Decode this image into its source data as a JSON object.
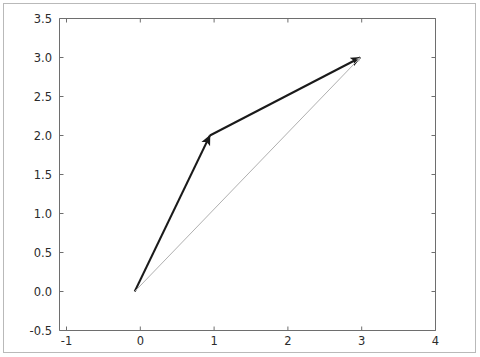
{
  "chart_data": {
    "type": "line",
    "title": "",
    "xlabel": "",
    "ylabel": "",
    "xlim": [
      -1,
      4
    ],
    "ylim": [
      -0.5,
      3.5
    ],
    "grid": false,
    "legend": null,
    "xticks": [
      "-1",
      "0",
      "1",
      "2",
      "3",
      "4"
    ],
    "xtick_values": [
      -1,
      0,
      1,
      2,
      3,
      4
    ],
    "yticks": [
      "-0.5",
      "0.0",
      "0.5",
      "1.0",
      "1.5",
      "2.0",
      "2.5",
      "3.0",
      "3.5"
    ],
    "ytick_values": [
      -0.5,
      0.0,
      0.5,
      1.0,
      1.5,
      2.0,
      2.5,
      3.0,
      3.5
    ],
    "annotations": [
      {
        "name": "vector-a",
        "kind": "arrow",
        "start": [
          0,
          0
        ],
        "end": [
          1,
          2
        ],
        "color": "#1a1a1a",
        "linewidth": 2.0,
        "arrowhead": true
      },
      {
        "name": "vector-b",
        "kind": "arrow",
        "start": [
          1,
          2
        ],
        "end": [
          3,
          3
        ],
        "color": "#1a1a1a",
        "linewidth": 2.0,
        "arrowhead": true
      },
      {
        "name": "vector-resultant",
        "kind": "arrow",
        "start": [
          0,
          0
        ],
        "end": [
          3,
          3
        ],
        "color": "#b0b0b0",
        "linewidth": 1.0,
        "arrowhead": true
      }
    ],
    "series": [
      {
        "name": "vector-a",
        "x": [
          0,
          1
        ],
        "values": [
          0,
          2
        ]
      },
      {
        "name": "vector-b",
        "x": [
          1,
          3
        ],
        "values": [
          2,
          3
        ]
      },
      {
        "name": "vector-resultant",
        "x": [
          0,
          3
        ],
        "values": [
          0,
          3
        ]
      }
    ]
  },
  "axes": {
    "spine_color": "#6e6e6e",
    "tick_color": "#6e6e6e",
    "background": "#ffffff"
  },
  "figure": {
    "border_color": "#b9b9b9",
    "background": "#ffffff"
  }
}
